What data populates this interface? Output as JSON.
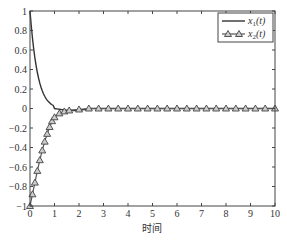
{
  "chart_data": {
    "type": "line",
    "title": "",
    "xlabel": "时间",
    "ylabel": "",
    "xlim": [
      0,
      10
    ],
    "ylim": [
      -1,
      1
    ],
    "xticks": [
      "0",
      "1",
      "2",
      "3",
      "4",
      "5",
      "6",
      "7",
      "8",
      "9",
      "10"
    ],
    "yticks": [
      "-1",
      "-0.8",
      "-0.6",
      "-0.4",
      "-0.2",
      "0",
      "0.2",
      "0.4",
      "0.6",
      "0.8",
      "1"
    ],
    "grid": false,
    "legend_position": "upper right",
    "series": [
      {
        "name": "x1(t)",
        "label_main": "x",
        "label_sub": "1",
        "label_tail": "(t)",
        "style": "solid line",
        "color": "#333333",
        "x": [
          0,
          0.1,
          0.2,
          0.3,
          0.4,
          0.5,
          0.6,
          0.8,
          1.0,
          1.2,
          1.5,
          2.0,
          3,
          4,
          5,
          6,
          7,
          8,
          9,
          10
        ],
        "y": [
          1,
          0.72,
          0.52,
          0.38,
          0.27,
          0.19,
          0.13,
          0.07,
          0.03,
          0.0,
          -0.02,
          -0.02,
          -0.01,
          0,
          0,
          0,
          0,
          0,
          0,
          0
        ]
      },
      {
        "name": "x2(t)",
        "label_main": "x",
        "label_sub": "2",
        "label_tail": "(t)",
        "style": "line with triangle markers",
        "color": "#555555",
        "x": [
          0,
          0.1,
          0.2,
          0.3,
          0.4,
          0.5,
          0.6,
          0.7,
          0.8,
          0.9,
          1.0,
          1.2,
          1.4,
          1.6,
          2.0,
          2.4,
          2.8,
          3.2,
          3.6,
          4.0,
          4.4,
          4.8,
          5.2,
          5.6,
          6.0,
          6.4,
          6.8,
          7.2,
          7.6,
          8.0,
          8.4,
          8.8,
          9.2,
          9.6,
          10
        ],
        "y": [
          -1,
          -0.88,
          -0.76,
          -0.64,
          -0.53,
          -0.43,
          -0.34,
          -0.26,
          -0.19,
          -0.13,
          -0.09,
          -0.05,
          -0.03,
          -0.02,
          -0.01,
          0,
          0,
          0,
          0,
          0,
          0,
          0,
          0,
          0,
          0,
          0,
          0,
          0,
          0,
          0,
          0,
          0,
          0,
          0,
          0
        ]
      }
    ]
  }
}
